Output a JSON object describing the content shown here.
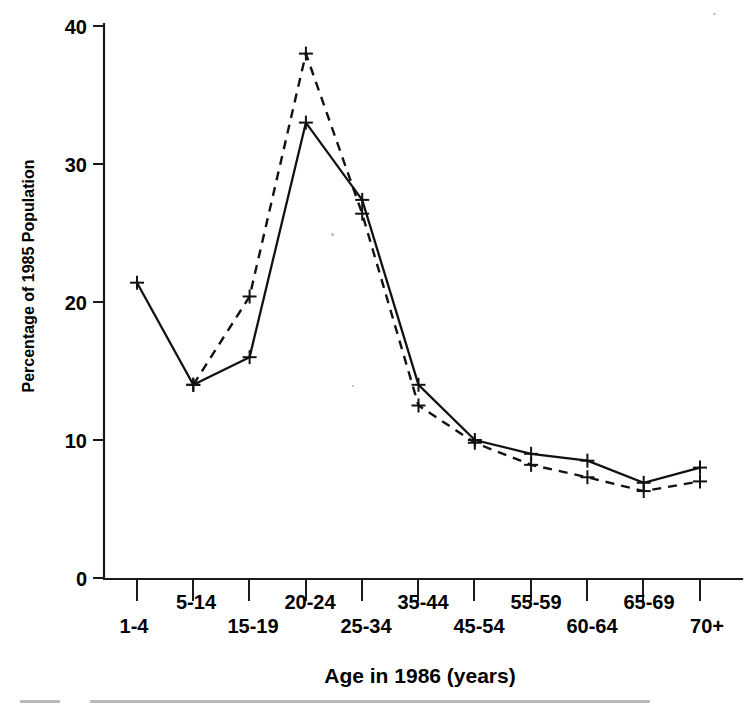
{
  "chart_data": {
    "type": "line",
    "title": "",
    "xlabel": "Age in 1986 (years)",
    "ylabel": "Percentage of 1985 Population",
    "categories": [
      "1-4",
      "5-14",
      "15-19",
      "20-24",
      "25-34",
      "35-44",
      "45-54",
      "55-59",
      "60-64",
      "65-69",
      "70+"
    ],
    "ylim": [
      0,
      40
    ],
    "yticks": [
      0,
      10,
      20,
      30,
      40
    ],
    "ytick_labels": [
      "0",
      "10",
      "20",
      "30",
      "40"
    ],
    "grid": false,
    "legend": "none",
    "series": [
      {
        "name": "solid-line",
        "style": "solid",
        "marker": "plus",
        "values": [
          21.4,
          14.0,
          16.0,
          33.0,
          27.4,
          14.0,
          10.0,
          9.0,
          8.5,
          6.9,
          8.0
        ]
      },
      {
        "name": "dashed-line",
        "style": "dashed",
        "marker": "plus",
        "values": [
          null,
          14.0,
          20.4,
          38.0,
          26.4,
          12.5,
          9.8,
          8.2,
          7.3,
          6.3,
          7.0
        ]
      }
    ]
  },
  "axes": {
    "y_axis_name": "percentage-of-1985-population",
    "x_axis_name": "age-in-1986-years"
  },
  "colors": {
    "ink": "#111111",
    "background": "#ffffff"
  }
}
